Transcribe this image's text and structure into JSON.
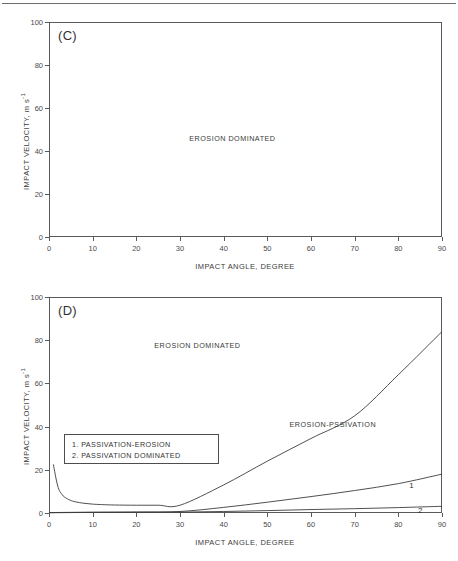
{
  "figure": {
    "has_top_rule": true,
    "background": "#ffffff",
    "line_color": "#3c3c3c",
    "axis_color": "#5a5a5a"
  },
  "axes_common": {
    "xlabel": "IMPACT ANGLE, DEGREE",
    "ylabel_text": "IMPACT VELOCITY,  m s",
    "ylabel_exponent": "-1",
    "xticks": [
      0,
      10,
      20,
      30,
      40,
      50,
      60,
      70,
      80,
      90
    ],
    "yticks": [
      0,
      20,
      40,
      60,
      80,
      100
    ],
    "xlim": [
      0,
      90
    ],
    "ylim": [
      0,
      100
    ]
  },
  "chart_data": [
    {
      "id": "panel-c",
      "type": "line",
      "panel_label": "(C)",
      "title": "",
      "xlabel": "IMPACT ANGLE, DEGREE",
      "ylabel": "IMPACT VELOCITY, m s-1",
      "xlim": [
        0,
        90
      ],
      "ylim": [
        0,
        100
      ],
      "xticks": [
        0,
        10,
        20,
        30,
        40,
        50,
        60,
        70,
        80,
        90
      ],
      "yticks": [
        0,
        20,
        40,
        60,
        80,
        100
      ],
      "grid": false,
      "legend": "none",
      "series": [],
      "annotations": [
        {
          "text": "EROSION DOMINATED",
          "x": 42,
          "y": 46
        }
      ]
    },
    {
      "id": "panel-d",
      "type": "line",
      "panel_label": "(D)",
      "title": "",
      "xlabel": "IMPACT ANGLE, DEGREE",
      "ylabel": "IMPACT VELOCITY, m s-1",
      "xlim": [
        0,
        90
      ],
      "ylim": [
        0,
        100
      ],
      "xticks": [
        0,
        10,
        20,
        30,
        40,
        50,
        60,
        70,
        80,
        90
      ],
      "yticks": [
        0,
        20,
        40,
        60,
        80,
        100
      ],
      "grid": false,
      "legend": "inset-box",
      "series": [
        {
          "name": "erosion / erosion-passivation boundary",
          "x": [
            1,
            2,
            3,
            4,
            5,
            6,
            8,
            10,
            12,
            15,
            20,
            25,
            30,
            40,
            50,
            60,
            70,
            80,
            90
          ],
          "values": [
            22.5,
            12.5,
            8.5,
            6.8,
            5.8,
            5.2,
            4.5,
            4.1,
            3.9,
            3.7,
            3.6,
            3.6,
            3.6,
            13.0,
            24.0,
            34.5,
            45.0,
            64.0,
            84.0
          ]
        },
        {
          "name": "1. PASSIVATION-EROSION",
          "x": [
            0,
            5,
            10,
            20,
            30,
            40,
            50,
            60,
            70,
            80,
            90
          ],
          "values": [
            0.2,
            0.3,
            0.4,
            0.5,
            0.7,
            2.6,
            5.0,
            7.6,
            10.4,
            13.6,
            18.0
          ]
        },
        {
          "name": "2. PASSIVATION DOMINATED",
          "x": [
            0,
            5,
            10,
            20,
            30,
            40,
            50,
            60,
            70,
            80,
            90
          ],
          "values": [
            0.1,
            0.2,
            0.25,
            0.3,
            0.4,
            0.7,
            1.1,
            1.6,
            2.0,
            2.5,
            3.1
          ]
        }
      ],
      "annotations": [
        {
          "text": "EROSION DOMINATED",
          "x": 34,
          "y": 78
        },
        {
          "text": "EROSION-PSSIVATION",
          "x": 65,
          "y": 41
        },
        {
          "text": "1",
          "x": 83,
          "y": 13
        },
        {
          "text": "2",
          "x": 85,
          "y": 1.5
        }
      ],
      "legend_items": [
        "1. PASSIVATION-EROSION",
        "2. PASSIVATION DOMINATED"
      ]
    }
  ]
}
